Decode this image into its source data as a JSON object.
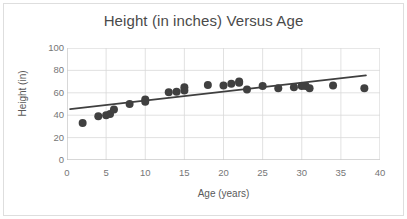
{
  "figure": {
    "width": 407,
    "height": 219,
    "background": "#ffffff",
    "border_color": "#dedede"
  },
  "chart_data": {
    "type": "scatter",
    "title": "Height (in inches) Versus Age",
    "xlabel": "Age (years)",
    "ylabel": "Height (in)",
    "xlim": [
      0,
      40
    ],
    "ylim": [
      0,
      100
    ],
    "xticks": [
      0,
      5,
      10,
      15,
      20,
      25,
      30,
      35,
      40
    ],
    "yticks": [
      0,
      20,
      40,
      60,
      80,
      100
    ],
    "grid": "both",
    "grid_color": "#d9d9d9",
    "legend": "none",
    "marker_color": "#404040",
    "marker_size": 5.4,
    "series": [
      {
        "name": "Height vs Age",
        "points": [
          [
            2,
            33
          ],
          [
            4,
            39
          ],
          [
            5,
            40
          ],
          [
            5.5,
            41
          ],
          [
            6,
            45
          ],
          [
            8,
            50
          ],
          [
            10,
            52
          ],
          [
            10,
            54
          ],
          [
            13,
            60.5
          ],
          [
            14,
            61
          ],
          [
            15,
            62
          ],
          [
            15,
            65
          ],
          [
            18,
            67
          ],
          [
            20,
            66.5
          ],
          [
            21,
            68
          ],
          [
            22,
            69
          ],
          [
            22,
            70
          ],
          [
            23,
            63
          ],
          [
            25,
            66
          ],
          [
            27,
            64
          ],
          [
            29,
            65
          ],
          [
            30,
            66
          ],
          [
            30.5,
            66
          ],
          [
            31,
            64
          ],
          [
            34,
            66.5
          ],
          [
            38,
            64
          ]
        ]
      }
    ],
    "trendline": {
      "type": "linear",
      "color": "#3f3f3f",
      "width": 1.8,
      "x_start": 0.4,
      "y_start": 45.5,
      "x_end": 38.2,
      "y_end": 75.5
    }
  }
}
